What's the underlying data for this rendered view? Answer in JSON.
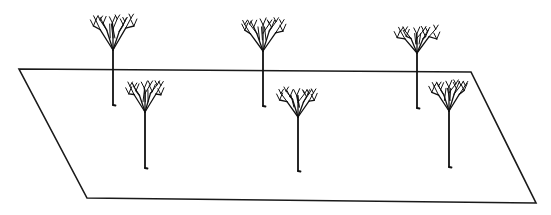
{
  "figure": {
    "width": 551,
    "height": 215,
    "stroke_color": "#111111",
    "background": "#ffffff"
  },
  "ground_plane": {
    "shape": "parallelogram",
    "corners": {
      "top_left": [
        19,
        69
      ],
      "top_right": [
        471,
        72
      ],
      "bottom_right": [
        536,
        203
      ],
      "bottom_left": [
        87,
        198
      ]
    }
  },
  "trees": [
    {
      "id": "back-1",
      "row": "back",
      "trunk_x": 113,
      "crown_top": 10,
      "crown_base": 50,
      "trunk_bottom": 105,
      "crown_width": 46
    },
    {
      "id": "back-2",
      "row": "back",
      "trunk_x": 263,
      "crown_top": 14,
      "crown_base": 51,
      "trunk_bottom": 106,
      "crown_width": 46
    },
    {
      "id": "back-3",
      "row": "back",
      "trunk_x": 417,
      "crown_top": 23,
      "crown_base": 53,
      "trunk_bottom": 108,
      "crown_width": 44
    },
    {
      "id": "front-1",
      "row": "front",
      "trunk_x": 145,
      "crown_top": 78,
      "crown_base": 112,
      "trunk_bottom": 168,
      "crown_width": 40
    },
    {
      "id": "front-2",
      "row": "front",
      "trunk_x": 298,
      "crown_top": 84,
      "crown_base": 117,
      "trunk_bottom": 171,
      "crown_width": 40
    },
    {
      "id": "front-3",
      "row": "front",
      "trunk_x": 449,
      "crown_top": 76,
      "crown_base": 111,
      "trunk_bottom": 167,
      "crown_width": 38
    }
  ]
}
